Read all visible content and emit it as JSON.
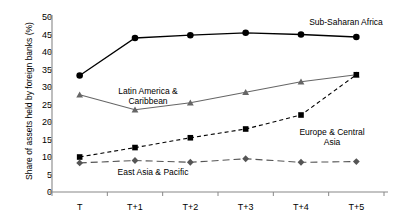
{
  "chart_data": {
    "type": "line",
    "title": "",
    "xlabel": "",
    "ylabel": "Share of assets held by foreign banks (%)",
    "categories": [
      "T",
      "T+1",
      "T+2",
      "T+3",
      "T+4",
      "T+5"
    ],
    "ylim": [
      0,
      50
    ],
    "yticks": [
      0,
      5,
      10,
      15,
      20,
      25,
      30,
      35,
      40,
      45,
      50
    ],
    "grid": false,
    "legend_position": "inline-annotations",
    "series": [
      {
        "name": "Sub-Saharan Africa",
        "values": [
          33.3,
          44.0,
          44.8,
          45.5,
          45.0,
          44.3
        ],
        "color": "#000000",
        "marker": "circle",
        "line_style": "solid"
      },
      {
        "name": "Latin America & Caribbean",
        "values": [
          27.8,
          23.5,
          25.5,
          28.5,
          31.5,
          33.5
        ],
        "color": "#666666",
        "marker": "triangle",
        "line_style": "solid"
      },
      {
        "name": "Europe & Central Asia",
        "values": [
          10.0,
          12.7,
          15.5,
          18.0,
          22.0,
          33.5
        ],
        "color": "#000000",
        "marker": "square",
        "line_style": "dashed"
      },
      {
        "name": "East Asia & Pacific",
        "values": [
          8.3,
          9.0,
          8.5,
          9.5,
          8.5,
          8.7
        ],
        "color": "#555555",
        "marker": "diamond",
        "line_style": "long-dashed"
      }
    ],
    "annotations": [
      {
        "text": "Sub-Saharan Africa",
        "series": "Sub-Saharan Africa"
      },
      {
        "text": "Latin America &\nCaribbean",
        "series": "Latin America & Caribbean"
      },
      {
        "text": "Europe & Central\nAsia",
        "series": "Europe & Central Asia"
      },
      {
        "text": "East Asia & Pacific",
        "series": "East Asia & Pacific"
      }
    ]
  }
}
